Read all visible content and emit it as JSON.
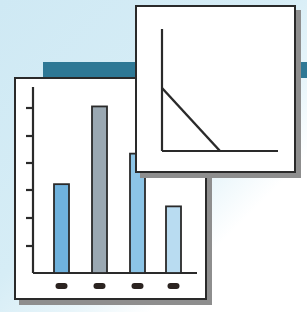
{
  "illustration": {
    "background_color": "#d2ebf5",
    "band_color": "#2e7895",
    "card_color": "#ffffff",
    "outline_color": "#2a2a2a",
    "shadow_color": "#8e8e8e"
  },
  "chart_data": [
    {
      "type": "bar",
      "title": "",
      "xlabel": "",
      "ylabel": "",
      "categories": [
        "",
        "",
        "",
        ""
      ],
      "values": [
        3.2,
        6.0,
        4.3,
        2.4
      ],
      "bar_colors": [
        "#6fb2dd",
        "#9aa8b2",
        "#8cc4e6",
        "#b9dcf1"
      ],
      "y_ticks": 6,
      "ylim": [
        0,
        6.7
      ],
      "grid": false,
      "legend": false,
      "category_markers": "dark ovals (unlabeled)"
    },
    {
      "type": "line",
      "title": "",
      "xlabel": "",
      "ylabel": "",
      "series": [
        {
          "name": "",
          "x": [
            0,
            1
          ],
          "y": [
            1,
            0
          ]
        }
      ],
      "xlim": [
        0,
        2
      ],
      "ylim": [
        0,
        2
      ],
      "grid": false,
      "legend": false
    }
  ]
}
